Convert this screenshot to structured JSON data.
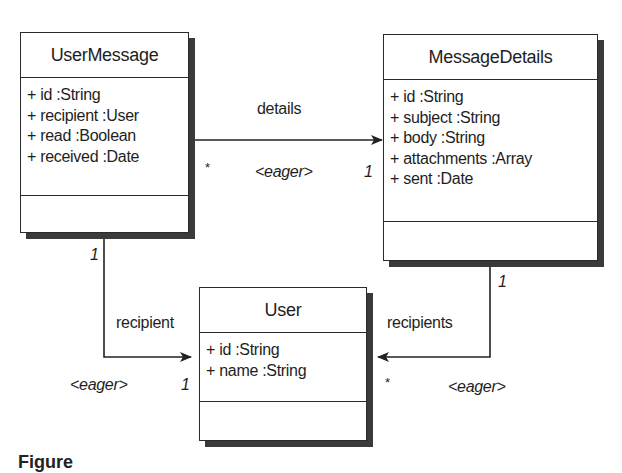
{
  "diagram": {
    "type": "UML class diagram",
    "classes": [
      {
        "name": "UserMessage",
        "attributes": [
          "+ id :String",
          "+ recipient :User",
          "+ read :Boolean",
          "+ received :Date"
        ],
        "operations": []
      },
      {
        "name": "MessageDetails",
        "attributes": [
          "+ id :String",
          "+ subject :String",
          "+ body :String",
          "+ attachments :Array",
          "+ sent :Date"
        ],
        "operations": []
      },
      {
        "name": "User",
        "attributes": [
          "+ id :String",
          "+ name :String"
        ],
        "operations": []
      }
    ],
    "associations": [
      {
        "from": "UserMessage",
        "to": "MessageDetails",
        "role": "details",
        "stereotype": "<eager>",
        "source_multiplicity": "*",
        "target_multiplicity": "1"
      },
      {
        "from": "UserMessage",
        "to": "User",
        "role": "recipient",
        "stereotype": "<eager>",
        "source_multiplicity": "1",
        "target_multiplicity": "1"
      },
      {
        "from": "MessageDetails",
        "to": "User",
        "role": "recipients",
        "stereotype": "<eager>",
        "source_multiplicity": "1",
        "target_multiplicity": "*"
      }
    ],
    "caption": "Figure"
  }
}
